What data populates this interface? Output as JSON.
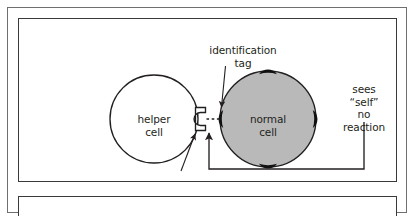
{
  "figure": {
    "type": "biology-diagram",
    "title_visible": false,
    "panels": [
      {
        "name": "upper-panel",
        "caption": null,
        "labels": {
          "identification_tag": "identification\ntag",
          "identification_tag_line1": "identification",
          "identification_tag_line2": "tag",
          "helper_cell_line1": "helper",
          "helper_cell_line2": "cell",
          "normal_cell_line1": "normal",
          "normal_cell_line2": "cell",
          "outcome_line1": "sees",
          "outcome_line2": "“self”",
          "outcome_line3": "no",
          "outcome_line4": "reaction",
          "receptor": "receptor"
        },
        "elements": {
          "helper_cell": {
            "label": "helper cell",
            "shape": "circle",
            "fill": "#ffffff",
            "stroke": "#231f20"
          },
          "normal_cell": {
            "label": "normal cell",
            "shape": "circle",
            "fill": "#b9b9b9",
            "stroke": "#231f20",
            "tag_count": 4,
            "tag_positions": [
              "top",
              "left",
              "right",
              "bottom"
            ],
            "tag_fill": "#111111"
          },
          "receptor": {
            "label": "receptor",
            "shape": "bracket-notch",
            "attached_to": "helper cell",
            "side": "right"
          },
          "binding": {
            "style": "dashed",
            "from": "receptor",
            "to": "identification tag"
          },
          "feedback_connector": {
            "style": "solid-elbow",
            "from": "no reaction",
            "to": "receptor",
            "arrowhead": true
          }
        }
      },
      {
        "name": "lower-panel",
        "caption": null,
        "cropped": true
      }
    ],
    "colors": {
      "ink": "#231f20",
      "page": "#ffffff",
      "cell_gray": "#b9b9b9",
      "tag_black": "#111111",
      "outer_frame": "#6f6f6f",
      "panel_frame": "#3a3a3a"
    }
  }
}
